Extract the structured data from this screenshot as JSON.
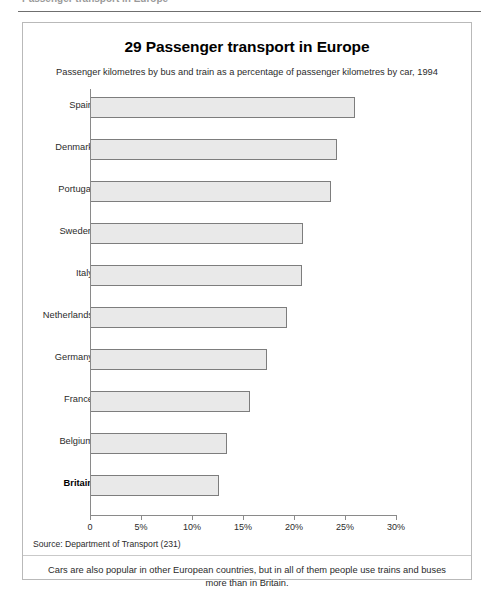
{
  "page": {
    "top_cut_text": "Passenger transport in Europe"
  },
  "figure": {
    "title": "29 Passenger transport in Europe",
    "subtitle": "Passenger kilometres by bus and train as a percentage of passenger kilometres by car, 1994",
    "source": "Source: Department of Transport (231)",
    "caption": "Cars are also popular in other European countries, but in all of them people use trains and buses more than in Britain."
  },
  "colors": {
    "bar_fill": "#e9e9e9",
    "bar_border": "#7d7d7d",
    "axis": "#8a8a8a",
    "frame": "#b9b9b9",
    "text": "#2b2b2b"
  },
  "chart_data": {
    "type": "bar",
    "orientation": "horizontal",
    "title": "29 Passenger transport in Europe",
    "subtitle": "Passenger kilometres by bus and train as a percentage of passenger kilometres by car, 1994",
    "xlabel": "",
    "ylabel": "",
    "xlim": [
      0,
      30
    ],
    "xticks": [
      0,
      5,
      10,
      15,
      20,
      25,
      30
    ],
    "xtick_labels": [
      "0",
      "5%",
      "10%",
      "15%",
      "20%",
      "25%",
      "30%"
    ],
    "grid": false,
    "legend": false,
    "unit": "%",
    "highlight_category": "Britain",
    "categories": [
      "Spain",
      "Denmark",
      "Portugal",
      "Sweden",
      "Italy",
      "Netherlands",
      "Germany",
      "France",
      "Belgium",
      "Britain"
    ],
    "values": [
      26.0,
      24.2,
      23.6,
      20.9,
      20.8,
      19.3,
      17.4,
      15.7,
      13.4,
      12.6
    ],
    "source": "Source: Department of Transport (231)",
    "annotation": "Cars are also popular in other European countries, but in all of them people use trains and buses more than in Britain."
  }
}
